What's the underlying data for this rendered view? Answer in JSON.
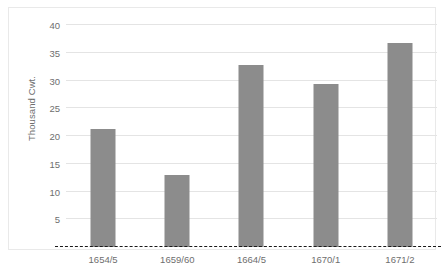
{
  "chart_data": {
    "type": "bar",
    "title": "",
    "xlabel": "",
    "ylabel": "Thousand Cwt.",
    "categories": [
      "1654/5",
      "1659/60",
      "1664/5",
      "1670/1",
      "1671/2"
    ],
    "values": [
      21.3,
      13.0,
      32.8,
      29.3,
      36.7
    ],
    "ylim": [
      0,
      40
    ],
    "yticks": [
      5,
      10,
      15,
      20,
      25,
      30,
      35,
      40
    ],
    "ytick_labels": [
      "5",
      "10",
      "15",
      "20",
      "25",
      "30",
      "35",
      "40"
    ],
    "grid": true,
    "legend": false,
    "bar_color": "#8c8c8c",
    "gridline_color": "#e4e4e4",
    "baseline_style": "dashed",
    "baseline_color": "#1a1a1a",
    "axis_text_color": "#6e6e6e"
  },
  "caption": {
    "text": ""
  }
}
